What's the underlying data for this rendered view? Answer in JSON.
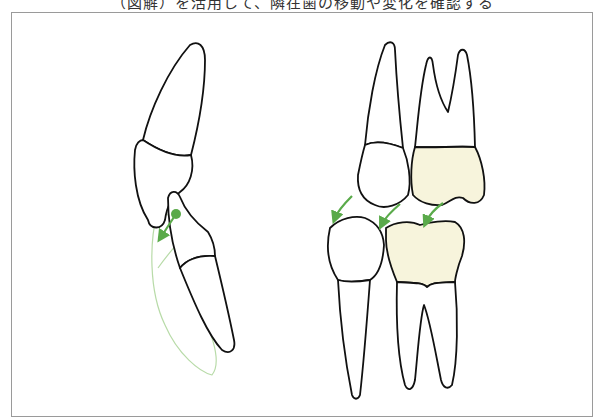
{
  "caption": "（図解）を活用して、隣在歯の移動や変化を確認する",
  "figure": {
    "panels": [
      {
        "name": "sagittal-view",
        "description": "Upper and lower anterior teeth, lateral view, with lingual tipping arrow"
      },
      {
        "name": "mesiodistal-view",
        "description": "Upper and lower premolar/molar with mesial drift arrows; molar crowns shaded"
      }
    ],
    "colors": {
      "outline": "#111111",
      "arrow": "#5aaa4a",
      "ghost_outline": "#b8dba8",
      "crown_fill": "#f7f4dc"
    }
  }
}
